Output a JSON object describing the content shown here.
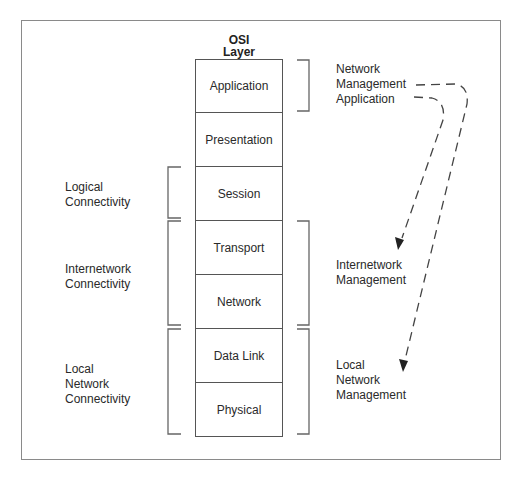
{
  "header": {
    "line1": "OSI",
    "line2": "Layer"
  },
  "layers": [
    {
      "label": "Application"
    },
    {
      "label": "Presentation"
    },
    {
      "label": "Session"
    },
    {
      "label": "Transport"
    },
    {
      "label": "Network"
    },
    {
      "label": "Data Link"
    },
    {
      "label": "Physical"
    }
  ],
  "left_groups": [
    {
      "lines": [
        "Logical",
        "Connectivity"
      ],
      "spans": [
        "Session"
      ]
    },
    {
      "lines": [
        "Internetwork",
        "Connectivity"
      ],
      "spans": [
        "Transport",
        "Network"
      ]
    },
    {
      "lines": [
        "Local",
        "Network",
        "Connectivity"
      ],
      "spans": [
        "Data Link",
        "Physical"
      ]
    }
  ],
  "right_groups": [
    {
      "lines": [
        "Network",
        "Management",
        "Application"
      ],
      "spans": [
        "Application"
      ]
    },
    {
      "lines": [
        "Internetwork",
        "Management"
      ],
      "spans": [
        "Transport",
        "Network"
      ]
    },
    {
      "lines": [
        "Local",
        "Network",
        "Management"
      ],
      "spans": [
        "Data Link",
        "Physical"
      ]
    }
  ],
  "arrows": [
    {
      "from": "Network Management Application",
      "to": "Internetwork Management",
      "style": "dashed"
    },
    {
      "from": "Network Management Application",
      "to": "Local Network Management",
      "style": "dashed"
    }
  ],
  "colors": {
    "frame": "#8a8a8a",
    "lines": "#555555",
    "text": "#2a2a2a"
  }
}
